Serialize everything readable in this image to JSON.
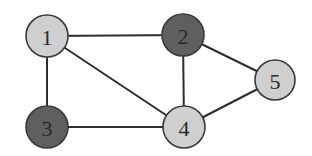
{
  "diagram": {
    "type": "undirected-graph",
    "colors": {
      "light_fill": "#cfcfcf",
      "dark_fill": "#5f5f5f",
      "edge": "#2e2e2e",
      "stroke": "#3a3a3a",
      "background": "#ffffff"
    },
    "nodes": [
      {
        "id": "1",
        "label": "1",
        "x": 47,
        "y": 36,
        "r": 21,
        "fill": "light"
      },
      {
        "id": "2",
        "label": "2",
        "x": 183,
        "y": 35,
        "r": 21,
        "fill": "dark"
      },
      {
        "id": "3",
        "label": "3",
        "x": 47,
        "y": 127,
        "r": 21,
        "fill": "dark"
      },
      {
        "id": "4",
        "label": "4",
        "x": 184,
        "y": 127,
        "r": 21,
        "fill": "light"
      },
      {
        "id": "5",
        "label": "5",
        "x": 275,
        "y": 80,
        "r": 20,
        "fill": "light"
      }
    ],
    "edges": [
      {
        "from": "1",
        "to": "2"
      },
      {
        "from": "1",
        "to": "3"
      },
      {
        "from": "1",
        "to": "4"
      },
      {
        "from": "2",
        "to": "4"
      },
      {
        "from": "2",
        "to": "5"
      },
      {
        "from": "3",
        "to": "4"
      },
      {
        "from": "4",
        "to": "5"
      }
    ]
  }
}
